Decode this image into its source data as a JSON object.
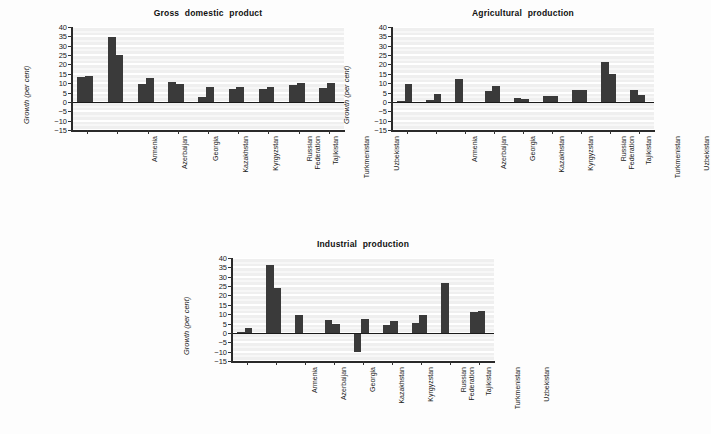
{
  "figure": {
    "background_color": "#fdfdfd",
    "plot_background_color": "#efefef",
    "gridline_color": "#ffffff",
    "bar_color": "#3a3a3a",
    "axis_color": "#2a2a2a"
  },
  "charts": [
    {
      "id": "gross-domestic-product",
      "title": "Gross domestic product",
      "ylabel": "Growth (per cent)",
      "yticks": [
        "40",
        "35",
        "30",
        "25",
        "20",
        "15",
        "10",
        "5",
        "0",
        "-5",
        "-10",
        "-15"
      ],
      "categories": [
        [
          "Armenia"
        ],
        [
          "Azerbaijan"
        ],
        [
          "Georgia"
        ],
        [
          "Kazakhstan"
        ],
        [
          "Kyrgyzstan"
        ],
        [
          "Russian",
          "Federation"
        ],
        [
          "Tajikistan"
        ],
        [
          "Turkmenistan"
        ],
        [
          "Uzbekistan"
        ]
      ]
    },
    {
      "id": "agricultural-production",
      "title": "Agricultural production",
      "ylabel": "Growth (per cent)",
      "yticks": [
        "40",
        "35",
        "30",
        "25",
        "20",
        "15",
        "10",
        "5",
        "0",
        "-5",
        "-10",
        "-15"
      ],
      "categories": [
        [
          "Armenia"
        ],
        [
          "Azerbaijan"
        ],
        [
          "Georgia"
        ],
        [
          "Kazakhstan"
        ],
        [
          "Kyrgyzstan"
        ],
        [
          "Russian",
          "Federation"
        ],
        [
          "Tajikistan"
        ],
        [
          "Turkmenistan"
        ],
        [
          "Uzbekistan"
        ]
      ]
    },
    {
      "id": "industrial-production",
      "title": "Industrial production",
      "ylabel": "Growth (per cent)",
      "yticks": [
        "40",
        "35",
        "30",
        "25",
        "20",
        "15",
        "10",
        "5",
        "0",
        "-5",
        "-10",
        "-15"
      ],
      "categories": [
        [
          "Armenia"
        ],
        [
          "Azerbaijan"
        ],
        [
          "Georgia"
        ],
        [
          "Kazakhstan"
        ],
        [
          "Kyrgyzstan"
        ],
        [
          "Russian",
          "Federation"
        ],
        [
          "Tajikistan"
        ],
        [
          "Turkmenistan"
        ],
        [
          "Uzbekistan"
        ]
      ]
    }
  ],
  "chart_data": [
    {
      "type": "bar",
      "title": "Gross domestic product",
      "xlabel": "",
      "ylabel": "Growth (per cent)",
      "ylim": [
        -15,
        40
      ],
      "ytick_step": 5,
      "grid": true,
      "legend": "none",
      "categories": [
        "Armenia",
        "Azerbaijan",
        "Georgia",
        "Kazakhstan",
        "Kyrgyzstan",
        "Russian Federation",
        "Tajikistan",
        "Turkmenistan",
        "Uzbekistan"
      ],
      "series": [
        {
          "name": "first",
          "values": [
            13.2,
            34.5,
            9.4,
            10.5,
            2.8,
            6.8,
            7.0,
            9.1,
            7.5
          ]
        },
        {
          "name": "second",
          "values": [
            13.9,
            25.0,
            12.7,
            9.7,
            8.2,
            8.2,
            7.9,
            10.3,
            10.0
          ]
        }
      ]
    },
    {
      "type": "bar",
      "title": "Agricultural production",
      "xlabel": "",
      "ylabel": "Growth (per cent)",
      "ylim": [
        -15,
        40
      ],
      "ytick_step": 5,
      "grid": true,
      "legend": "none",
      "categories": [
        "Armenia",
        "Azerbaijan",
        "Georgia",
        "Kazakhstan",
        "Kyrgyzstan",
        "Russian Federation",
        "Tajikistan",
        "Turkmenistan",
        "Uzbekistan"
      ],
      "series": [
        {
          "name": "first",
          "values": [
            0.3,
            0.9,
            12.2,
            5.9,
            2.0,
            2.9,
            6.2,
            21.5,
            6.1
          ]
        },
        {
          "name": "second",
          "values": [
            9.6,
            4.0,
            0.0,
            8.3,
            1.6,
            3.3,
            6.6,
            14.8,
            3.6
          ]
        }
      ]
    },
    {
      "type": "bar",
      "title": "Industrial production",
      "xlabel": "",
      "ylabel": "Growth (per cent)",
      "ylim": [
        -15,
        40
      ],
      "ytick_step": 5,
      "grid": true,
      "legend": "none",
      "categories": [
        "Armenia",
        "Azerbaijan",
        "Georgia",
        "Kazakhstan",
        "Kyrgyzstan",
        "Russian Federation",
        "Tajikistan",
        "Turkmenistan",
        "Uzbekistan"
      ],
      "series": [
        {
          "name": "first",
          "values": [
            0.3,
            36.5,
            9.4,
            7.0,
            -10.2,
            4.2,
            5.2,
            26.6,
            11.0
          ]
        },
        {
          "name": "second",
          "values": [
            2.7,
            24.1,
            0.0,
            4.8,
            7.4,
            6.4,
            9.8,
            0.0,
            11.8
          ]
        }
      ]
    }
  ]
}
